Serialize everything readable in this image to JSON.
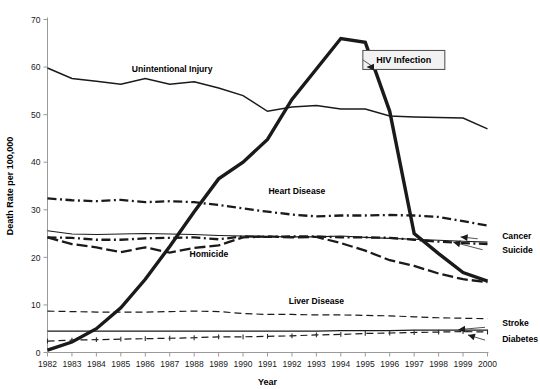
{
  "chart_data": {
    "type": "line",
    "title": "",
    "xlabel": "Year",
    "ylabel": "Death Rate per 100,000",
    "x": [
      1982,
      1983,
      1984,
      1985,
      1986,
      1987,
      1988,
      1989,
      1990,
      1991,
      1992,
      1993,
      1994,
      1995,
      1996,
      1997,
      1998,
      1999,
      2000
    ],
    "xtick_labels": [
      "1982",
      "1983",
      "1984",
      "1985",
      "1986",
      "1987",
      "1988",
      "1989",
      "1990",
      "1991",
      "1992",
      "1993",
      "1994",
      "1995",
      "1996",
      "1997",
      "1998",
      "1999",
      "2000"
    ],
    "ytick_labels": [
      "0",
      "10",
      "20",
      "30",
      "40",
      "50",
      "60",
      "70"
    ],
    "ylim": [
      0,
      70
    ],
    "xlim": [
      1982,
      2000
    ],
    "ytick_step": 10,
    "grid": false,
    "legend_position": "inline-annotations",
    "series": [
      {
        "name": "Unintentional Injury",
        "style": "solid-thin",
        "label_x": 1987.1,
        "label_y": 59.0,
        "label_anchor": "middle",
        "values": [
          59.8,
          57.6,
          57.0,
          56.4,
          57.6,
          56.4,
          56.9,
          55.6,
          54.0,
          50.7,
          51.6,
          51.9,
          51.2,
          51.2,
          49.7,
          49.5,
          49.4,
          49.3,
          47.0
        ]
      },
      {
        "name": "HIV Infection",
        "style": "solid-thick",
        "callout": true,
        "callout_x": 1994.9,
        "callout_y": 61.5,
        "values": [
          0.5,
          2.2,
          5.0,
          9.4,
          15.4,
          22.3,
          29.6,
          36.5,
          40.0,
          44.8,
          53.2,
          59.6,
          66.0,
          65.2,
          50.7,
          25.0,
          20.8,
          16.8,
          15.0
        ]
      },
      {
        "name": "Heart Disease",
        "style": "dash-dot-thick",
        "label_x": 1992.2,
        "label_y": 33.4,
        "label_anchor": "middle",
        "values": [
          32.4,
          32.0,
          31.8,
          32.1,
          31.6,
          31.8,
          31.6,
          31.0,
          30.3,
          29.6,
          29.0,
          28.6,
          28.8,
          28.8,
          28.9,
          28.8,
          28.5,
          27.6,
          26.7
        ]
      },
      {
        "name": "Cancer",
        "style": "dash-dot-thick",
        "label_x": 2000.6,
        "label_y": 23.9,
        "label_anchor": "start",
        "arrow_from_x": 1999.6,
        "arrow_from_y": 23.9,
        "arrow_to_x": 1998.9,
        "arrow_to_y": 24.3,
        "values": [
          24.2,
          24.1,
          23.7,
          23.7,
          24.0,
          24.1,
          24.2,
          23.8,
          24.4,
          24.3,
          24.4,
          24.4,
          24.2,
          24.2,
          24.1,
          23.7,
          23.3,
          23.0,
          22.8
        ]
      },
      {
        "name": "Suicide",
        "style": "solid-gray-thin",
        "label_x": 2000.6,
        "label_y": 21.0,
        "label_anchor": "start",
        "arrow_from_x": 1999.8,
        "arrow_from_y": 21.6,
        "arrow_to_x": 1998.6,
        "arrow_to_y": 23.2,
        "values": [
          25.6,
          24.9,
          24.8,
          24.9,
          25.0,
          24.9,
          24.8,
          24.6,
          24.5,
          24.4,
          24.3,
          24.3,
          24.5,
          24.2,
          24.0,
          23.8,
          23.6,
          23.4,
          23.2
        ]
      },
      {
        "name": "Homicide",
        "style": "dash-long-thick",
        "label_x": 1988.6,
        "label_y": 20.0,
        "label_anchor": "middle",
        "values": [
          24.2,
          22.8,
          22.1,
          21.1,
          22.1,
          21.0,
          22.0,
          22.5,
          24.2,
          24.4,
          24.2,
          24.3,
          23.0,
          21.4,
          19.4,
          18.2,
          16.6,
          15.4,
          14.8
        ]
      },
      {
        "name": "Liver Disease",
        "style": "dash-med-thin",
        "label_x": 1993.0,
        "label_y": 10.1,
        "label_anchor": "middle",
        "values": [
          8.7,
          8.6,
          8.5,
          8.5,
          8.5,
          8.6,
          8.7,
          8.6,
          8.2,
          8.0,
          8.0,
          7.9,
          7.9,
          7.8,
          7.7,
          7.5,
          7.3,
          7.2,
          7.1
        ]
      },
      {
        "name": "Stroke",
        "style": "solid-gray-thin",
        "label_x": 2000.6,
        "label_y": 5.6,
        "label_anchor": "start",
        "arrow_from_x": 1999.9,
        "arrow_from_y": 5.3,
        "arrow_to_x": 1998.8,
        "arrow_to_y": 4.8,
        "values": [
          4.5,
          4.5,
          4.5,
          4.5,
          4.5,
          4.5,
          4.5,
          4.5,
          4.5,
          4.5,
          4.5,
          4.5,
          4.6,
          4.6,
          4.6,
          4.7,
          4.7,
          4.7,
          4.7
        ]
      },
      {
        "name": "Diabetes",
        "style": "dash-marker-thin",
        "label_x": 2000.6,
        "label_y": 2.3,
        "label_anchor": "start",
        "arrow_from_x": 1999.9,
        "arrow_from_y": 2.6,
        "arrow_to_x": 1999.2,
        "arrow_to_y": 3.7,
        "values": [
          2.4,
          2.6,
          2.7,
          2.8,
          2.9,
          3.0,
          3.1,
          3.3,
          3.3,
          3.4,
          3.5,
          3.7,
          3.8,
          4.0,
          4.1,
          4.2,
          4.3,
          4.4,
          4.3
        ]
      }
    ]
  }
}
